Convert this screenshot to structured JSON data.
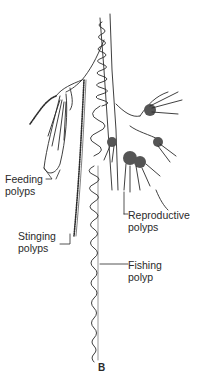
{
  "figure": {
    "letter": "B",
    "line_color": "#2a2a2a",
    "background": "#ffffff"
  },
  "labels": [
    {
      "id": "feeding",
      "line1": "Feeding",
      "line2": "polyps"
    },
    {
      "id": "stinging",
      "line1": "Stinging",
      "line2": "polyps"
    },
    {
      "id": "reproductive",
      "line1": "Reproductive",
      "line2": "polyps"
    },
    {
      "id": "fishing",
      "line1": "Fishing",
      "line2": "polyp"
    }
  ]
}
